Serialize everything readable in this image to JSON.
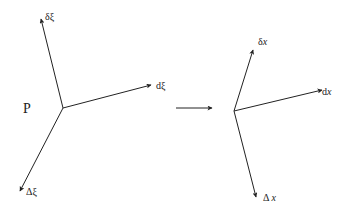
{
  "diagram": {
    "left": {
      "point_label": "P",
      "vectors": [
        {
          "name": "delta-xi",
          "label": "δξ"
        },
        {
          "name": "d-xi",
          "label": "dξ"
        },
        {
          "name": "Delta-xi",
          "label": "Δξ"
        }
      ]
    },
    "transform_arrow": "→",
    "right": {
      "vectors": [
        {
          "name": "delta-x",
          "prefix": "δ",
          "var": "x"
        },
        {
          "name": "d-x",
          "prefix": "d",
          "var": "x"
        },
        {
          "name": "Delta-x",
          "prefix": "Δ",
          "var": "x"
        }
      ]
    },
    "colors": {
      "stroke": "#222222",
      "background": "#ffffff"
    }
  }
}
